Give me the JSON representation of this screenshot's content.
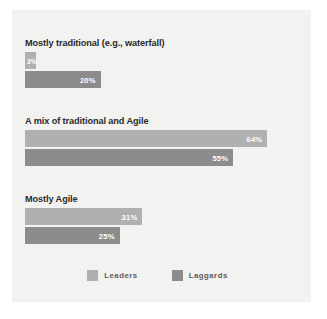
{
  "chart_data": {
    "type": "bar",
    "orientation": "horizontal",
    "title": "",
    "xlabel": "",
    "ylabel": "",
    "xlim": [
      0,
      70
    ],
    "grid": false,
    "legend_position": "bottom-center",
    "categories": [
      "Mostly traditional (e.g., waterfall)",
      "A mix of traditional and Agile",
      "Mostly Agile"
    ],
    "series": [
      {
        "name": "Leaders",
        "color": "#b0b0b0",
        "values": [
          3,
          64,
          31
        ],
        "labels": [
          "3%",
          "64%",
          "31%"
        ]
      },
      {
        "name": "Laggards",
        "color": "#8c8c8c",
        "values": [
          20,
          55,
          25
        ],
        "labels": [
          "20%",
          "55%",
          "25%"
        ]
      }
    ]
  },
  "legend": {
    "items": [
      {
        "label": "Leaders",
        "color": "#b0b0b0"
      },
      {
        "label": "Laggards",
        "color": "#8c8c8c"
      }
    ]
  },
  "colors": {
    "panel_background": "#f2f2f1",
    "page_background": "#ffffff",
    "leaders": "#b0b0b0",
    "laggards": "#8c8c8c",
    "label_text": "#2b2b2b",
    "legend_text": "#5d5d5d",
    "value_text": "#ffffff"
  }
}
